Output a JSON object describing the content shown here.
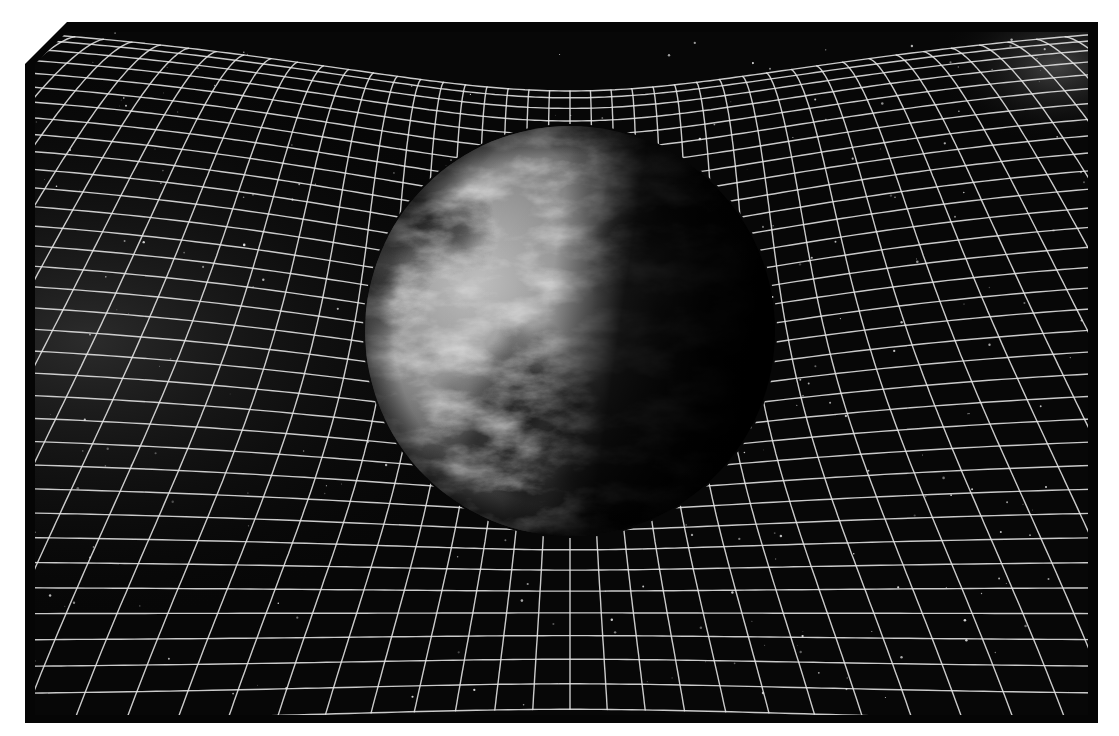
{
  "image": {
    "subject": "Earth curving the fabric of space-time",
    "description": "Grayscale illustration of planet Earth sitting in a warped grid representing space-time curvature, star field background",
    "palette": {
      "background": "#080808",
      "frame": "#050505",
      "grid_line": "#e8e8e8",
      "earth_light": "#d9d9d9",
      "earth_mid": "#7a7a7a",
      "earth_dark": "#0a0a0a",
      "haze": "#3a3a3a"
    }
  },
  "scene": {
    "earth": {
      "cx": 535,
      "cy": 299,
      "r": 205
    },
    "grid": {
      "rows": 34,
      "cols": 44,
      "stroke_width": 1.4
    },
    "stars": {
      "count": 260,
      "seed": 7
    }
  }
}
